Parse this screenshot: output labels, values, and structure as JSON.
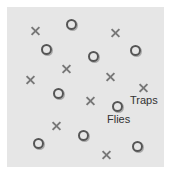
{
  "diagram": {
    "labels": {
      "traps": "Traps",
      "flies": "Flies"
    },
    "colors": {
      "background": "#e6e6e6",
      "fly_marker": "#555555",
      "trap_marker": "#777777"
    },
    "flies": [
      {
        "x": 71,
        "y": 24
      },
      {
        "x": 46,
        "y": 49
      },
      {
        "x": 93,
        "y": 56
      },
      {
        "x": 135,
        "y": 50
      },
      {
        "x": 58,
        "y": 93
      },
      {
        "x": 117,
        "y": 106
      },
      {
        "x": 83,
        "y": 135
      },
      {
        "x": 38,
        "y": 143
      },
      {
        "x": 137,
        "y": 146
      }
    ],
    "traps": [
      {
        "x": 35,
        "y": 30
      },
      {
        "x": 115,
        "y": 32
      },
      {
        "x": 66,
        "y": 68
      },
      {
        "x": 30,
        "y": 79
      },
      {
        "x": 110,
        "y": 76
      },
      {
        "x": 143,
        "y": 87
      },
      {
        "x": 90,
        "y": 100
      },
      {
        "x": 56,
        "y": 125
      },
      {
        "x": 106,
        "y": 154
      }
    ]
  }
}
